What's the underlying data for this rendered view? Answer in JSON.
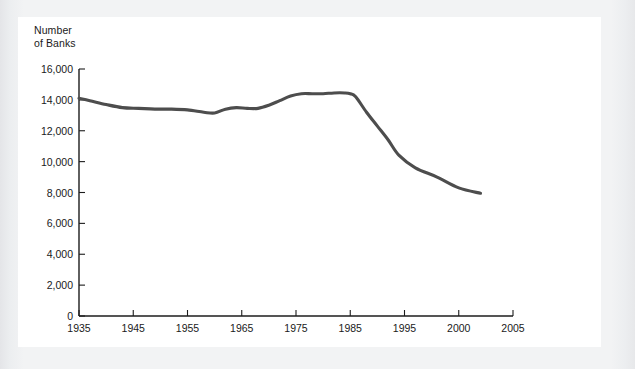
{
  "figure": {
    "background_color": "#f1f2f4",
    "panel_color": "#ffffff",
    "axis_color": "#1c1c1c",
    "line_color": "#4d4d4d"
  },
  "chart_data": {
    "type": "line",
    "title": "",
    "ylabel": "Number\nof Banks",
    "ylabel_line1": "Number",
    "ylabel_line2": "of Banks",
    "xlabel": "",
    "ylim": [
      0,
      16000
    ],
    "y_ticks": [
      0,
      2000,
      4000,
      6000,
      8000,
      10000,
      12000,
      14000,
      16000
    ],
    "y_tick_labels": [
      "0",
      "2,000",
      "4,000",
      "6,000",
      "8,000",
      "10,000",
      "12,000",
      "14,000",
      "16,000"
    ],
    "x_ticks": [
      1935,
      1945,
      1955,
      1965,
      1975,
      1985,
      1995,
      2000,
      2005
    ],
    "x_tick_labels": [
      "1935",
      "1945",
      "1955",
      "1965",
      "1975",
      "1985",
      "1995",
      "2000",
      "2005"
    ],
    "grid": false,
    "legend": false,
    "series": [
      {
        "name": "Number of Banks",
        "x": [
          1935,
          1937,
          1940,
          1943,
          1946,
          1949,
          1952,
          1955,
          1958,
          1960,
          1962,
          1964,
          1966,
          1968,
          1970,
          1972,
          1974,
          1976,
          1978,
          1980,
          1982,
          1984,
          1985,
          1986,
          1988,
          1990,
          1992,
          1994,
          1996,
          1998,
          2000,
          2002
        ],
        "values": [
          14100,
          13950,
          13700,
          13500,
          13450,
          13400,
          13400,
          13350,
          13200,
          13150,
          13400,
          13500,
          13450,
          13450,
          13650,
          13950,
          14250,
          14400,
          14400,
          14400,
          14450,
          14450,
          14400,
          14200,
          13200,
          12300,
          11400,
          10400,
          9600,
          9000,
          8300,
          7950
        ],
        "color": "#4d4d4d",
        "style": "solid",
        "width": 3
      }
    ]
  }
}
